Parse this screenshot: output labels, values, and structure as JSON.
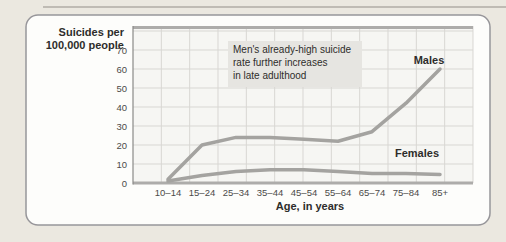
{
  "palette": {
    "page_bg": "#ebe8e0",
    "top_rule": "#b0ada6",
    "card_bg": "#fdfdfb",
    "card_border": "#97969a",
    "plot_bg": "#f6f6f3",
    "grid": "#d8d7d3",
    "axis_thick": "#adacaa",
    "axis_left": "#8a8a88",
    "line": "#a4a3a0",
    "annotation_bg": "#e6e5e1",
    "text_dark": "#2e2d2b",
    "tick_text": "#4c4b49"
  },
  "chart_data": {
    "type": "line",
    "categories": [
      "10–14",
      "15–24",
      "25–34",
      "35–44",
      "45–54",
      "55–64",
      "65–74",
      "75–84",
      "85+"
    ],
    "series": [
      {
        "name": "Males",
        "values": [
          2,
          20,
          24,
          24,
          23,
          22,
          27,
          42,
          60
        ]
      },
      {
        "name": "Females",
        "values": [
          1,
          4,
          6,
          7,
          7,
          6,
          5,
          5,
          4.5
        ]
      }
    ],
    "ylabel_line1": "Suicides per",
    "ylabel_line2": "100,000 people",
    "xlabel": "Age, in years",
    "yticks": [
      0,
      10,
      20,
      30,
      40,
      50,
      60,
      70
    ],
    "ylim": [
      0,
      82
    ],
    "grid": true,
    "legend_position": "inline-labels",
    "annotation": {
      "line1": "Men's already-high suicide",
      "line2": "rate further increases",
      "line3": "in late adulthood"
    }
  }
}
